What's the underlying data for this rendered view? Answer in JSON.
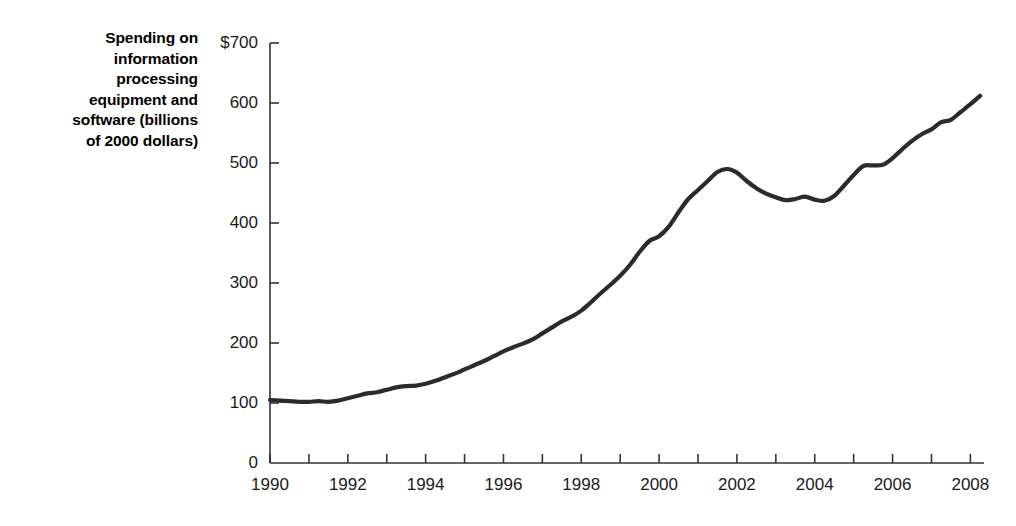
{
  "chart_data": {
    "type": "line",
    "title": "",
    "xlabel": "",
    "ylabel": "Spending on information processing equipment and software (billions of 2000 dollars)",
    "ylabel_lines": [
      "Spending on",
      "information",
      "processing",
      "equipment and",
      "software (billions",
      "of 2000 dollars)"
    ],
    "xlim": [
      1990,
      2008.35
    ],
    "ylim": [
      0,
      700
    ],
    "grid": false,
    "legend": null,
    "line_color": "#2b2b2b",
    "line_width": 4.2,
    "axis_color": "#333333",
    "y_ticks": [
      0,
      100,
      200,
      300,
      400,
      500,
      600,
      700
    ],
    "y_tick_labels": [
      "0",
      "100",
      "200",
      "300",
      "400",
      "500",
      "600",
      "$700"
    ],
    "x_ticks": [
      1990,
      1991,
      1992,
      1993,
      1994,
      1995,
      1996,
      1997,
      1998,
      1999,
      2000,
      2001,
      2002,
      2003,
      2004,
      2005,
      2006,
      2007,
      2008
    ],
    "x_tick_labels": [
      "1990",
      "",
      "1992",
      "",
      "1994",
      "",
      "1996",
      "",
      "1998",
      "",
      "2000",
      "",
      "2002",
      "",
      "2004",
      "",
      "2006",
      "",
      "2008"
    ],
    "series": [
      {
        "name": "Spending on information processing equipment and software",
        "x": [
          1990.0,
          1990.25,
          1990.5,
          1990.75,
          1991.0,
          1991.25,
          1991.5,
          1991.75,
          1992.0,
          1992.25,
          1992.5,
          1992.75,
          1993.0,
          1993.25,
          1993.5,
          1993.75,
          1994.0,
          1994.25,
          1994.5,
          1994.75,
          1995.0,
          1995.25,
          1995.5,
          1995.75,
          1996.0,
          1996.25,
          1996.5,
          1996.75,
          1997.0,
          1997.25,
          1997.5,
          1997.75,
          1998.0,
          1998.25,
          1998.5,
          1998.75,
          1999.0,
          1999.25,
          1999.5,
          1999.75,
          2000.0,
          2000.25,
          2000.5,
          2000.75,
          2001.0,
          2001.25,
          2001.5,
          2001.75,
          2002.0,
          2002.25,
          2002.5,
          2002.75,
          2003.0,
          2003.25,
          2003.5,
          2003.75,
          2004.0,
          2004.25,
          2004.5,
          2004.75,
          2005.0,
          2005.25,
          2005.5,
          2005.75,
          2006.0,
          2006.25,
          2006.5,
          2006.75,
          2007.0,
          2007.25,
          2007.5,
          2007.75,
          2008.0,
          2008.25
        ],
        "values": [
          105,
          104,
          103,
          102,
          102,
          103,
          102,
          104,
          108,
          112,
          116,
          118,
          122,
          126,
          128,
          129,
          132,
          137,
          143,
          149,
          156,
          163,
          170,
          178,
          186,
          193,
          199,
          206,
          216,
          226,
          236,
          244,
          254,
          268,
          283,
          297,
          312,
          330,
          352,
          370,
          378,
          394,
          418,
          440,
          455,
          470,
          485,
          490,
          484,
          470,
          458,
          449,
          443,
          438,
          440,
          444,
          439,
          437,
          445,
          462,
          480,
          495,
          496,
          497,
          508,
          523,
          537,
          548,
          556,
          568,
          572,
          585,
          598,
          612
        ]
      }
    ],
    "annotations": [
      {
        "label": "start-1990",
        "x": 1990,
        "y": 105
      },
      {
        "label": "dot-com-peak",
        "x": 2001.2,
        "y": 490
      },
      {
        "label": "trough",
        "x": 2003.1,
        "y": 437
      },
      {
        "label": "2004-plateau",
        "x": 2004.6,
        "y": 495
      },
      {
        "label": "end-2008",
        "x": 2008.3,
        "y": 685
      }
    ]
  }
}
